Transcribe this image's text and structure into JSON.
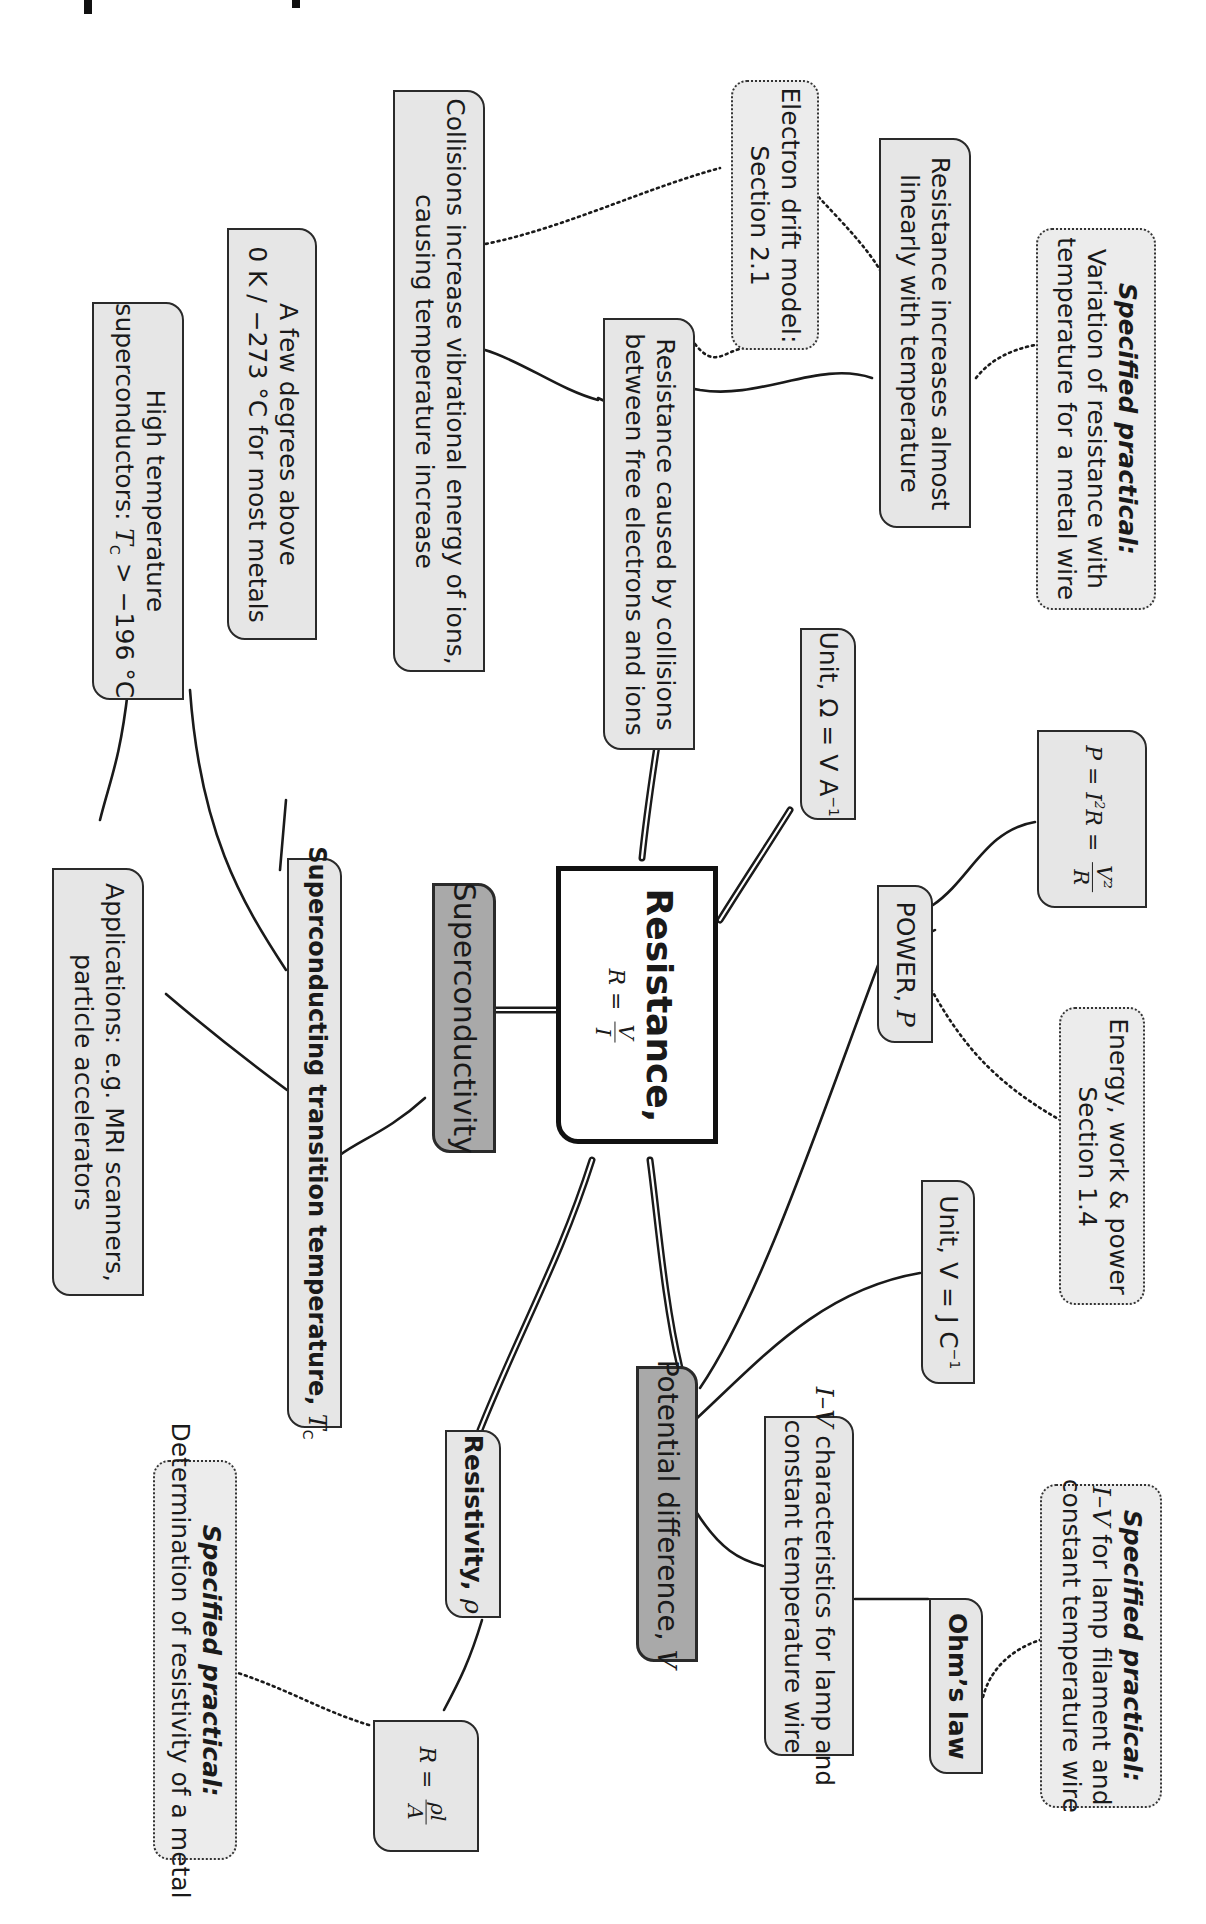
{
  "page": {
    "orientation": "rotated 90 degrees clockwise",
    "colors": {
      "background": "#ffffff",
      "node_fill": "#e6e6e6",
      "main_branch_fill": "#a9a9a9",
      "border": "#2a2a2a",
      "center_fill": "#ffffff"
    }
  },
  "center": {
    "title": "Resistance,",
    "formula_lhs": "R =",
    "formula_num": "V",
    "formula_den": "I"
  },
  "branches": {
    "superconductivity": {
      "label": "Superconductivity",
      "transition_temp": {
        "label": "Superconducting transition temperature, ",
        "symbol": "T",
        "subscript": "C"
      },
      "few_degrees": {
        "line1": "A few degrees above",
        "line2": "0 K / −273 °C for most metals"
      },
      "high_temp": {
        "line1": "High temperature",
        "line2_pre": "superconductors: ",
        "symbol": "T",
        "subscript": "C",
        "line2_post": " > −196 °C"
      },
      "applications": {
        "line1": "Applications: e.g. MRI scanners,",
        "line2": "particle accelerators"
      }
    },
    "collisions": {
      "cause": {
        "line1": "Resistance caused by collisions",
        "line2": "between free electrons and ions"
      },
      "vibrational": {
        "line1": "Collisions increase vibrational energy of ions,",
        "line2": "causing temperature increase"
      },
      "linear": {
        "line1": "Resistance increases almost",
        "line2": "linearly with temperature"
      },
      "drift_ref": {
        "line1": "Electron drift model:",
        "line2": "Section 2.1"
      },
      "practical_temp": {
        "heading": "Specified practical:",
        "line1": "Variation of resistance with",
        "line2": "temperature for a metal wire"
      }
    },
    "unit_ohm": {
      "pre": "Unit, Ω = V A",
      "sup": "−1"
    },
    "power": {
      "label_pre": "POWER, ",
      "symbol": "P",
      "formula": {
        "lhs": "P = I",
        "sup": "2",
        "mid": "R =",
        "num": "V²",
        "den": "R"
      },
      "energy_ref": {
        "line1": "Energy, work & power",
        "line2": "Section 1.4"
      }
    },
    "potential_difference": {
      "label_pre": "Potential difference, ",
      "symbol": "V",
      "unit": {
        "pre": "Unit, V = J C",
        "sup": "−1"
      },
      "iv_char": {
        "sym": "I–V",
        "line1_post": " characteristics for lamp and",
        "line2": "constant temperature wire"
      },
      "ohms_law": {
        "label": "Ohm’s law"
      },
      "practical_iv": {
        "heading": "Specified practical:",
        "sym": "I–V",
        "line1_post": " for lamp filament and",
        "line2": "constant temperature wire"
      }
    },
    "resistivity": {
      "label_pre": "Resistivity, ",
      "symbol": "ρ",
      "formula": {
        "lhs": "R =",
        "num": "ρl",
        "den": "A"
      },
      "practical": {
        "heading": "Specified practical:",
        "line1": "Determination of resistivity of a metal"
      }
    }
  }
}
